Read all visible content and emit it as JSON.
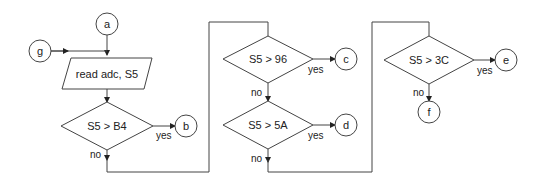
{
  "diagram": {
    "type": "flowchart",
    "connectors": {
      "a": "a",
      "b": "b",
      "c": "c",
      "d": "d",
      "e": "e",
      "f": "f",
      "g": "g"
    },
    "process": {
      "read": "read adc, S5"
    },
    "decisions": {
      "d1": "S5 > B4",
      "d2": "S5 > 96",
      "d3": "S5 > 5A",
      "d4": "S5 > 3C"
    },
    "labels": {
      "yes": "yes",
      "no": "no"
    },
    "colors": {
      "stroke": "#444444",
      "background": "#ffffff",
      "text": "#222222"
    }
  }
}
